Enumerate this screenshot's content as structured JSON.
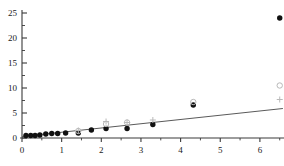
{
  "chart_data": {
    "type": "scatter",
    "title": "",
    "subtitle": "",
    "xlabel": "",
    "ylabel": "",
    "xlim": [
      0,
      6.62
    ],
    "ylim": [
      0,
      25.6
    ],
    "grid": false,
    "legend": "none",
    "x_ticks": [
      0,
      1,
      2,
      3,
      4,
      5,
      6
    ],
    "x_tick_labels": [
      "0",
      "1",
      "2",
      "3",
      "4",
      "5",
      "6"
    ],
    "x_minor_ticks": [
      0.5,
      1.5,
      2.5,
      3.5,
      4.5,
      5.5,
      6.5
    ],
    "y_ticks": [
      0,
      5,
      10,
      15,
      20,
      25
    ],
    "y_tick_labels": [
      "0",
      "5",
      "10",
      "15",
      "20",
      "25"
    ],
    "y_minor_ticks": [
      2.5,
      7.5,
      12.5,
      17.5,
      22.5
    ],
    "series": [
      {
        "name": "filled-circles",
        "marker": "filled-circle",
        "color": "#111111",
        "points": [
          [
            0.1,
            0.5
          ],
          [
            0.22,
            0.5
          ],
          [
            0.33,
            0.5
          ],
          [
            0.45,
            0.6
          ],
          [
            0.6,
            0.8
          ],
          [
            0.75,
            0.9
          ],
          [
            0.9,
            0.9
          ],
          [
            1.1,
            1.0
          ],
          [
            1.42,
            1.0
          ],
          [
            1.75,
            1.6
          ],
          [
            2.12,
            1.9
          ],
          [
            2.65,
            1.9
          ],
          [
            3.3,
            2.7
          ],
          [
            4.32,
            6.6
          ],
          [
            6.5,
            24.0
          ]
        ]
      },
      {
        "name": "open-circles",
        "marker": "open-circle",
        "color": "#b9b9b9",
        "points": [
          [
            1.42,
            1.4
          ],
          [
            2.12,
            2.8
          ],
          [
            2.65,
            3.1
          ],
          [
            4.32,
            7.2
          ],
          [
            6.5,
            10.5
          ]
        ]
      },
      {
        "name": "plus-markers",
        "marker": "plus",
        "color": "#b9b9b9",
        "points": [
          [
            1.42,
            1.5
          ],
          [
            2.12,
            3.3
          ],
          [
            2.65,
            3.1
          ],
          [
            3.3,
            3.6
          ],
          [
            6.5,
            7.7
          ]
        ]
      }
    ],
    "fit_line": {
      "name": "regression-line",
      "color": "#5a5a5a",
      "start": [
        0.0,
        0.3
      ],
      "end": [
        6.58,
        5.9
      ]
    }
  }
}
